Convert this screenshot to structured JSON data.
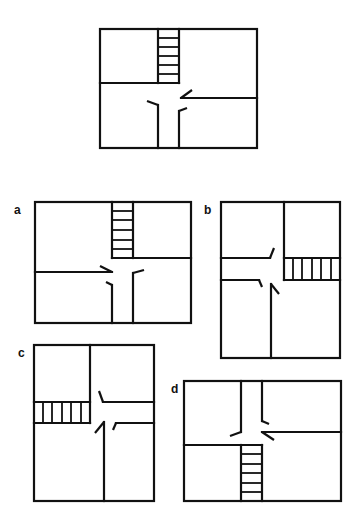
{
  "figure": {
    "type": "mental-rotation-floor-plan-test",
    "reference_plan": {
      "description": "Floor plan with staircase at top-center, T-shaped corridor, four rooms"
    },
    "options": [
      {
        "label": "a"
      },
      {
        "label": "b"
      },
      {
        "label": "c"
      },
      {
        "label": "d"
      }
    ]
  },
  "colors": {
    "line": "#111111",
    "background": "#ffffff"
  }
}
